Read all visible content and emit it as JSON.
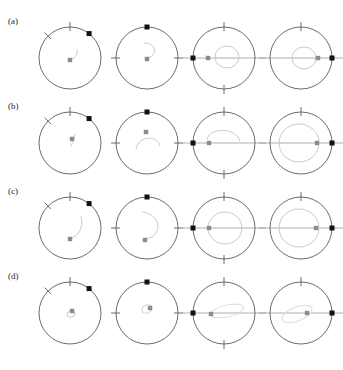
{
  "figure": {
    "title_fragment": "",
    "width": 336,
    "height": 370,
    "background": "#ffffff"
  },
  "colors": {
    "circle_stroke": "#5a5a5a",
    "tick_stroke": "#5a5a5a",
    "axis_stroke": "#9a9a9a",
    "marker_black": "#111111",
    "dot_gray": "#8c8c8c",
    "orbit_gray": "#c9c9c9",
    "orbit_gray_light": "#dcdcdc",
    "label_color": "#262626"
  },
  "geometry": {
    "panel_width": 84,
    "panel_height": 85,
    "circle_radius": 31,
    "circle_cx": 42,
    "circle_cy": 44,
    "tick_length": 9,
    "marker_size": 5,
    "dot_radius": 2.4
  },
  "rows": [
    {
      "label": "(a)",
      "top": 14,
      "panels": [
        {
          "name": "panel-a-1",
          "ticks_deg": [
            90,
            135
          ],
          "axis": "none",
          "marker_deg": 52,
          "dot": {
            "x": 42,
            "y": 46
          },
          "orbit": {
            "type": "arc-small",
            "path": "M 49 36 C 50 42 46 45 43 45"
          }
        },
        {
          "name": "panel-a-2",
          "ticks_deg": [
            0,
            180
          ],
          "axis": "none",
          "marker_deg": 90,
          "dot": {
            "x": 42,
            "y": 45
          },
          "orbit": {
            "type": "arc-medium",
            "path": "M 39 29 C 51 29 54 40 43 44"
          }
        },
        {
          "name": "panel-a-3",
          "ticks_deg": [
            90,
            270
          ],
          "axis": "horizontal",
          "marker_deg": 180,
          "dot": {
            "x": 26,
            "y": 44
          },
          "orbit": {
            "type": "circle",
            "cx": 45,
            "cy": 43,
            "rx": 12,
            "ry": 11
          }
        },
        {
          "name": "panel-a-4",
          "ticks_deg": [
            90
          ],
          "axis": "horizontal",
          "marker_deg": 0,
          "dot": {
            "x": 59,
            "y": 44
          },
          "orbit": {
            "type": "circle",
            "cx": 45,
            "cy": 44,
            "rx": 12,
            "ry": 11
          }
        }
      ]
    },
    {
      "label": "(b)",
      "top": 99,
      "panels": [
        {
          "name": "panel-b-1",
          "ticks_deg": [
            90,
            135
          ],
          "axis": "none",
          "marker_deg": 52,
          "dot": {
            "x": 44,
            "y": 40
          },
          "orbit": {
            "type": "arc-small",
            "path": "M 47 35 C 46 41 44 44 43 47"
          }
        },
        {
          "name": "panel-b-2",
          "ticks_deg": [
            0,
            180
          ],
          "axis": "none",
          "marker_deg": 90,
          "dot": {
            "x": 41,
            "y": 33
          },
          "orbit": {
            "type": "arc-medium",
            "path": "M 31 50 C 33 37 52 35 55 47"
          }
        },
        {
          "name": "panel-b-3",
          "ticks_deg": [
            90,
            270
          ],
          "axis": "horizontal",
          "marker_deg": 180,
          "dot": {
            "x": 27,
            "y": 44
          },
          "orbit": {
            "type": "arc-medium",
            "path": "M 25 40 C 28 28 54 28 58 42"
          }
        },
        {
          "name": "panel-b-4",
          "ticks_deg": [
            90
          ],
          "axis": "horizontal",
          "marker_deg": 0,
          "dot": {
            "x": 58,
            "y": 44
          },
          "orbit": {
            "type": "circle",
            "cx": 40,
            "cy": 44,
            "rx": 20,
            "ry": 19
          }
        }
      ]
    },
    {
      "label": "(c)",
      "top": 184,
      "panels": [
        {
          "name": "panel-c-1",
          "ticks_deg": [
            90,
            135
          ],
          "axis": "none",
          "marker_deg": 52,
          "dot": {
            "x": 42,
            "y": 55
          },
          "orbit": {
            "type": "arc-long",
            "path": "M 53 32 C 57 46 47 54 43 54"
          }
        },
        {
          "name": "panel-c-2",
          "ticks_deg": [
            0,
            180
          ],
          "axis": "none",
          "marker_deg": 90,
          "dot": {
            "x": 40,
            "y": 56
          },
          "orbit": {
            "type": "arc-long",
            "path": "M 38 28 C 57 31 58 52 41 55"
          }
        },
        {
          "name": "panel-c-3",
          "ticks_deg": [
            90,
            270
          ],
          "axis": "horizontal",
          "marker_deg": 180,
          "dot": {
            "x": 27,
            "y": 44
          },
          "orbit": {
            "type": "circle",
            "cx": 43,
            "cy": 44,
            "rx": 17,
            "ry": 16
          }
        },
        {
          "name": "panel-c-4",
          "ticks_deg": [
            90
          ],
          "axis": "horizontal",
          "marker_deg": 0,
          "dot": {
            "x": 57,
            "y": 44
          },
          "orbit": {
            "type": "circle",
            "cx": 40,
            "cy": 44,
            "rx": 20,
            "ry": 19
          }
        }
      ]
    },
    {
      "label": "(d)",
      "top": 269,
      "panels": [
        {
          "name": "panel-d-1",
          "ticks_deg": [
            90,
            135
          ],
          "axis": "none",
          "marker_deg": 52,
          "dot": {
            "x": 44,
            "y": 42
          },
          "orbit": {
            "type": "loop-tiny",
            "cx": 43,
            "cy": 45,
            "rx": 4,
            "ry": 3,
            "rot": -20
          }
        },
        {
          "name": "panel-d-2",
          "ticks_deg": [
            0,
            180
          ],
          "axis": "none",
          "marker_deg": 90,
          "dot": {
            "x": 45,
            "y": 39
          },
          "orbit": {
            "type": "loop-tiny",
            "cx": 42,
            "cy": 40,
            "rx": 5,
            "ry": 4,
            "rot": -25
          }
        },
        {
          "name": "panel-d-3",
          "ticks_deg": [
            90,
            270
          ],
          "axis": "horizontal",
          "marker_deg": 180,
          "dot": {
            "x": 29,
            "y": 45
          },
          "orbit": {
            "type": "loop-long",
            "cx": 45,
            "cy": 42,
            "rx": 17,
            "ry": 6,
            "rot": -12
          }
        },
        {
          "name": "panel-d-4",
          "ticks_deg": [
            90
          ],
          "axis": "horizontal",
          "marker_deg": 0,
          "dot": {
            "x": 48,
            "y": 44
          },
          "orbit": {
            "type": "loop-long",
            "cx": 38,
            "cy": 45,
            "rx": 16,
            "ry": 7,
            "rot": -22
          }
        }
      ]
    }
  ]
}
